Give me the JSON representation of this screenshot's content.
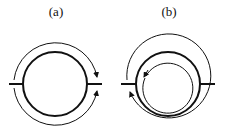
{
  "panels": [
    {
      "label": "(a)",
      "description": "thick circle with two external arcs both pointing toward right junction"
    },
    {
      "label": "(b)",
      "description": "thick circle with external arc and inner arc, arrows toward left junction"
    }
  ],
  "colors": {
    "stroke": "#111111",
    "background": "#ffffff"
  }
}
